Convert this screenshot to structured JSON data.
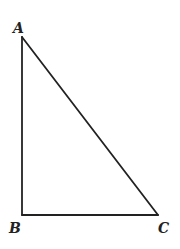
{
  "diagram": {
    "type": "right-triangle",
    "stroke_color": "#222222",
    "background": "#ffffff",
    "vertices": [
      {
        "id": "A",
        "label": "A",
        "x": 22,
        "y": 37,
        "label_x": 13,
        "label_y": 33
      },
      {
        "id": "B",
        "label": "B",
        "x": 22,
        "y": 215,
        "label_x": 9,
        "label_y": 233
      },
      {
        "id": "C",
        "label": "C",
        "x": 158,
        "y": 215,
        "label_x": 158,
        "label_y": 233
      }
    ],
    "edges": [
      {
        "from": "A",
        "to": "B"
      },
      {
        "from": "B",
        "to": "C"
      },
      {
        "from": "C",
        "to": "A"
      }
    ],
    "right_angle_at": "B"
  }
}
